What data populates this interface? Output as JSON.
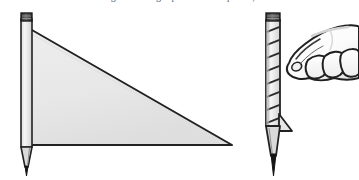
{
  "image": {
    "title": "Pencil flag diagram",
    "width": 359,
    "height": 180,
    "background_color": "#ffffff"
  },
  "caption": {
    "text": "a line drawing of a triangle pennant on a pencil, and a hand",
    "note": "clipped at top edge"
  },
  "palette": {
    "ink": "#1b1b1b",
    "outline": "#2a2a2a",
    "flag_fill": "#e9e9e9",
    "flag_fill_shadow": "#dddddd",
    "pencil_body": "#f2f2f2",
    "pencil_shade": "#cfcfcf",
    "ferrule_dark": "#4a4a4a",
    "ferrule_darker": "#2e2e2e",
    "graphite": "#171717",
    "wood": "#d8d8d8",
    "hand_fill": "#ffffff",
    "hand_shade": "#e2e2e2"
  },
  "figures": [
    {
      "id": "left-figure",
      "name": "large-pennant-on-pencil",
      "label": "Large triangular pennant attached to a vertical pencil",
      "parts": [
        {
          "name": "pencil-ferrule",
          "label": "Eraser ferrule"
        },
        {
          "name": "pencil-shaft",
          "label": "Pencil shaft"
        },
        {
          "name": "pencil-wood-cone",
          "label": "Sharpened wood cone"
        },
        {
          "name": "pencil-graphite-tip",
          "label": "Graphite point"
        },
        {
          "name": "pennant-triangle",
          "label": "Large gray triangle flag"
        }
      ],
      "geometry": {
        "pencil_x": 22,
        "pencil_top_y": 13,
        "pencil_tip_y": 172,
        "triangle_apex": [
          24,
          26
        ],
        "triangle_right": [
          232,
          145
        ],
        "triangle_base": [
          24,
          145
        ]
      }
    },
    {
      "id": "right-figure",
      "name": "striped-pencil-with-pointing-hand",
      "label": "Spiral striped pencil with a hand pointing at it",
      "parts": [
        {
          "name": "pencil-ferrule",
          "label": "Eraser ferrule"
        },
        {
          "name": "pencil-shaft-striped",
          "label": "Spiral wrapped pencil shaft"
        },
        {
          "name": "small-pennant-triangle",
          "label": "Small gray triangle flag"
        },
        {
          "name": "pencil-wood-cone",
          "label": "Sharpened wood cone"
        },
        {
          "name": "pencil-graphite-tip",
          "label": "Graphite point"
        },
        {
          "name": "pointing-hand",
          "label": "Hand with index finger pointing"
        }
      ],
      "geometry": {
        "pencil_x": 266,
        "pencil_top_y": 13,
        "pencil_tip_y": 172,
        "stripe_count": 8,
        "hand_origin": [
          276,
          24
        ]
      }
    }
  ]
}
